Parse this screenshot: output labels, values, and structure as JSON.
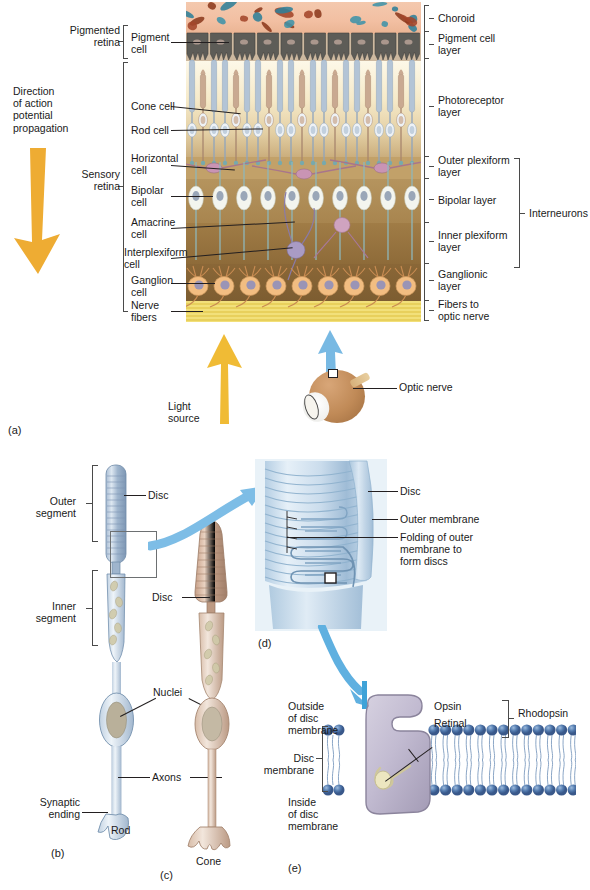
{
  "figure": {
    "domain_note": "Retina microanatomy and photoreceptor structure"
  },
  "panel_a": {
    "id": "(a)",
    "direction_label": "Direction\nof action\npotential\npropagation",
    "light_source_label": "Light\nsource",
    "optic_nerve_label": "Optic nerve",
    "left_brackets": [
      {
        "label": "Pigmented\nretina"
      },
      {
        "label": "Sensory\nretina"
      }
    ],
    "left_labels": [
      {
        "label": "Pigment\ncell"
      },
      {
        "label": "Cone cell"
      },
      {
        "label": "Rod cell"
      },
      {
        "label": "Horizontal\ncell"
      },
      {
        "label": "Bipolar\ncell"
      },
      {
        "label": "Amacrine\ncell"
      },
      {
        "label": "Interplexiform\ncell"
      },
      {
        "label": "Ganglion\ncell"
      },
      {
        "label": "Nerve\nfibers"
      }
    ],
    "right_labels": [
      {
        "label": "Choroid"
      },
      {
        "label": "Pigment cell\nlayer"
      },
      {
        "label": "Photoreceptor\nlayer"
      },
      {
        "label": "Outer plexiform\nlayer"
      },
      {
        "label": "Bipolar layer"
      },
      {
        "label": "Inner plexiform\nlayer"
      },
      {
        "label": "Ganglionic\nlayer"
      },
      {
        "label": "Fibers to\noptic nerve"
      }
    ],
    "interneurons_label": "Interneurons"
  },
  "panel_b": {
    "id": "(b)",
    "cell_name": "Rod",
    "labels": [
      {
        "label": "Outer\nsegment"
      },
      {
        "label": "Inner\nsegment"
      },
      {
        "label": "Disc"
      },
      {
        "label": "Nuclei"
      },
      {
        "label": "Axons"
      },
      {
        "label": "Synaptic\nending"
      }
    ]
  },
  "panel_c": {
    "id": "(c)",
    "cell_name": "Cone",
    "labels": [
      {
        "label": "Disc"
      }
    ]
  },
  "panel_d": {
    "id": "(d)",
    "labels": [
      {
        "label": "Disc"
      },
      {
        "label": "Outer membrane"
      },
      {
        "label": "Folding of outer\nmembrane to\nform discs"
      }
    ]
  },
  "panel_e": {
    "id": "(e)",
    "labels": [
      {
        "label": "Outside\nof disc\nmembrane"
      },
      {
        "label": "Disc\nmembrane"
      },
      {
        "label": "Inside\nof disc\nmembrane"
      },
      {
        "label": "Opsin"
      },
      {
        "label": "Retinal"
      },
      {
        "label": "Rhodopsin"
      }
    ]
  },
  "colors": {
    "arrow_orange": "#eeac33",
    "arrow_blue": "#6bb4e0",
    "choroid": "#f2bfa2",
    "pigment_layer": "#55544f",
    "photoreceptor_layer": "#f6eac9",
    "bipolar_layer": "#a8854f",
    "ganglionic_layer": "#7d5d31",
    "nerve_fiber_layer": "#ecd35f",
    "rod_blue": "#b9cbdd",
    "cone_tan": "#d6b49c",
    "membrane_blue": "#4d74ab",
    "opsin_violet": "#bfb8cc"
  }
}
